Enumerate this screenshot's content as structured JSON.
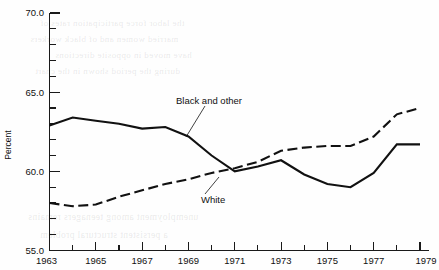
{
  "figure": {
    "width": 439,
    "height": 270,
    "background": "#ffffff",
    "ink_color": "#111111"
  },
  "chart_data": {
    "type": "line",
    "title": "",
    "subtitle": "",
    "xlabel": "",
    "ylabel": "Percent",
    "xlim": [
      1963,
      1979
    ],
    "ylim": [
      55.0,
      70.0
    ],
    "grid": false,
    "legend_position": "inline-annotations",
    "y_ticks_major": [
      "55.0",
      "60.0",
      "65.0",
      "70.0"
    ],
    "y_tick_values_major": [
      55.0,
      60.0,
      65.0,
      70.0
    ],
    "y_minor_interval": 1.0,
    "x_ticks_labeled": [
      "1963",
      "1965",
      "1967",
      "1969",
      "1971",
      "1973",
      "1975",
      "1977",
      "1979"
    ],
    "x_tick_values_labeled": [
      1963,
      1965,
      1967,
      1969,
      1971,
      1973,
      1975,
      1977,
      1979
    ],
    "x": [
      1963,
      1964,
      1965,
      1966,
      1967,
      1968,
      1969,
      1970,
      1971,
      1972,
      1973,
      1974,
      1975,
      1976,
      1977,
      1978,
      1979
    ],
    "series": [
      {
        "name": "Black and other",
        "style": "solid",
        "color": "#111111",
        "label_text": "Black and other",
        "values": [
          62.9,
          63.4,
          63.2,
          63.0,
          62.7,
          62.8,
          62.2,
          61.0,
          60.0,
          60.3,
          60.7,
          59.8,
          59.2,
          59.0,
          59.9,
          61.7,
          61.7
        ]
      },
      {
        "name": "White",
        "style": "dashed",
        "color": "#111111",
        "label_text": "White",
        "values": [
          58.0,
          57.8,
          57.9,
          58.4,
          58.8,
          59.2,
          59.5,
          59.9,
          60.2,
          60.6,
          61.3,
          61.5,
          61.6,
          61.6,
          62.2,
          63.6,
          64.0
        ]
      }
    ],
    "annotations": [
      {
        "text": "Black and other",
        "x_px": 176,
        "y_px": 101
      },
      {
        "text": "White",
        "x_px": 201,
        "y_px": 200
      }
    ]
  },
  "bleed_through": {
    "note": "faint reversed text showing through from the reverse side of the printed page",
    "lines": [
      "the labor force participation rates of",
      "married women and of black workers",
      "have moved in opposite directions",
      "during the period shown in the chart",
      "unemployment among teenagers remains",
      "a persistent structural problem"
    ]
  }
}
